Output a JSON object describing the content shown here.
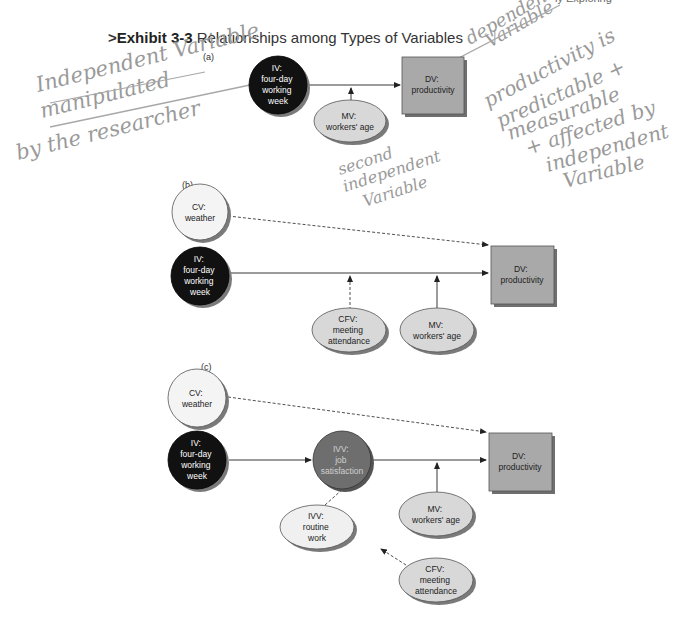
{
  "header": {
    "running_head": "ly Exploring",
    "exhibit_prefix": ">",
    "exhibit_number": "Exhibit 3-3",
    "exhibit_title": "Relationships among Types of Variables"
  },
  "panels": [
    {
      "label": "(a)",
      "nodes": [
        {
          "id": "iv",
          "shape": "circle",
          "fill": "#111111",
          "text_color": "#ffffff",
          "lines": [
            "IV:",
            "four-day",
            "working",
            "week"
          ]
        },
        {
          "id": "dv",
          "shape": "square",
          "fill": "#a9a9a9",
          "text_color": "#222222",
          "lines": [
            "DV:",
            "productivity"
          ]
        },
        {
          "id": "mv",
          "shape": "ellipse",
          "fill": "#d8d8d8",
          "text_color": "#222222",
          "lines": [
            "MV:",
            "workers' age"
          ]
        }
      ],
      "edges": [
        {
          "from": "iv",
          "to": "dv",
          "style": "solid"
        },
        {
          "from": "mv",
          "to": "iv-dv",
          "style": "solid"
        }
      ]
    },
    {
      "label": "(b)",
      "nodes": [
        {
          "id": "cv",
          "shape": "circle",
          "fill": "#f4f4f4",
          "text_color": "#222222",
          "lines": [
            "CV:",
            "weather"
          ]
        },
        {
          "id": "iv",
          "shape": "circle",
          "fill": "#111111",
          "text_color": "#ffffff",
          "lines": [
            "IV:",
            "four-day",
            "working",
            "week"
          ]
        },
        {
          "id": "dv",
          "shape": "square",
          "fill": "#a9a9a9",
          "text_color": "#222222",
          "lines": [
            "DV:",
            "productivity"
          ]
        },
        {
          "id": "cfv",
          "shape": "ellipse",
          "fill": "#d8d8d8",
          "text_color": "#222222",
          "lines": [
            "CFV:",
            "meeting",
            "attendance"
          ]
        },
        {
          "id": "mv",
          "shape": "ellipse",
          "fill": "#d8d8d8",
          "text_color": "#222222",
          "lines": [
            "MV:",
            "workers' age"
          ]
        }
      ],
      "edges": [
        {
          "from": "cv",
          "to": "dv",
          "style": "dashed"
        },
        {
          "from": "iv",
          "to": "dv",
          "style": "solid"
        },
        {
          "from": "cfv",
          "to": "iv-dv",
          "style": "dashed"
        },
        {
          "from": "mv",
          "to": "iv-dv",
          "style": "solid"
        }
      ]
    },
    {
      "label": "(c)",
      "nodes": [
        {
          "id": "cv",
          "shape": "circle",
          "fill": "#f4f4f4",
          "text_color": "#222222",
          "lines": [
            "CV:",
            "weather"
          ]
        },
        {
          "id": "iv",
          "shape": "circle",
          "fill": "#111111",
          "text_color": "#ffffff",
          "lines": [
            "IV:",
            "four-day",
            "working",
            "week"
          ]
        },
        {
          "id": "ivv_job",
          "shape": "circle",
          "fill": "#6e6e6e",
          "text_color": "#cfcfcf",
          "lines": [
            "IVV:",
            "job",
            "satisfaction"
          ]
        },
        {
          "id": "dv",
          "shape": "square",
          "fill": "#a9a9a9",
          "text_color": "#222222",
          "lines": [
            "DV:",
            "productivity"
          ]
        },
        {
          "id": "mv",
          "shape": "ellipse",
          "fill": "#d8d8d8",
          "text_color": "#222222",
          "lines": [
            "MV:",
            "workers' age"
          ]
        },
        {
          "id": "ivv_routine",
          "shape": "ellipse",
          "fill": "#f0f0f0",
          "text_color": "#222222",
          "lines": [
            "IVV:",
            "routine",
            "work"
          ]
        },
        {
          "id": "cfv",
          "shape": "ellipse",
          "fill": "#d8d8d8",
          "text_color": "#222222",
          "lines": [
            "CFV:",
            "meeting",
            "attendance"
          ]
        }
      ],
      "edges": [
        {
          "from": "cv",
          "to": "dv",
          "style": "dashed"
        },
        {
          "from": "iv",
          "to": "ivv_job",
          "style": "solid"
        },
        {
          "from": "ivv_job",
          "to": "dv",
          "style": "solid"
        },
        {
          "from": "ivv_routine",
          "to": "ivv_job-dv",
          "style": "dashed"
        },
        {
          "from": "mv",
          "to": "ivv_job-dv",
          "style": "solid"
        },
        {
          "from": "cfv",
          "to": "ivv_routine",
          "style": "dashed"
        }
      ]
    }
  ],
  "annotations": {
    "left_note": [
      "Independent Variable",
      "manipulated",
      "by the researcher"
    ],
    "top_right_note": [
      "dependent",
      "Variable"
    ],
    "right_note": [
      "productivity is",
      "predictable +",
      "measurable",
      "+ affected by",
      "independent",
      "Variable"
    ],
    "middle_note": [
      "second",
      "independent",
      "Variable"
    ]
  },
  "colors": {
    "iv_fill": "#111111",
    "dv_fill": "#a9a9a9",
    "ellipse_fill": "#d8d8d8",
    "cv_fill": "#f4f4f4",
    "ivv_job_fill": "#6e6e6e",
    "shadow": "#7a7a7a",
    "handwriting": "#9a9a9a"
  }
}
